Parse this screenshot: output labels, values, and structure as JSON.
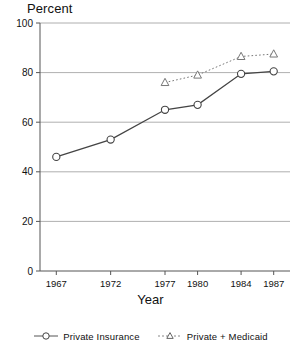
{
  "chart_data": {
    "type": "line",
    "title": "",
    "ylabel": "Percent",
    "xlabel": "Year",
    "categories": [
      "1967",
      "1972",
      "1977",
      "1980",
      "1984",
      "1987"
    ],
    "x": [
      1967,
      1972,
      1977,
      1980,
      1984,
      1987
    ],
    "xlim": [
      1965.5,
      1988.5
    ],
    "ylim": [
      0,
      100
    ],
    "yticks": [
      0,
      20,
      40,
      60,
      80,
      100
    ],
    "ytick_labels": [
      "0",
      "20",
      "40",
      "60",
      "80",
      "100"
    ],
    "xtick_labels": [
      "1967",
      "1972",
      "1977",
      "1980",
      "1984",
      "1987"
    ],
    "grid": "horizontal",
    "legend_position": "bottom",
    "series": [
      {
        "name": "Private Insurance",
        "marker": "circle",
        "linestyle": "solid",
        "color": "#444444",
        "x": [
          1967,
          1972,
          1977,
          1980,
          1984,
          1987
        ],
        "values": [
          46,
          53,
          65,
          67,
          79.5,
          80.5
        ]
      },
      {
        "name": "Private + Medicaid",
        "marker": "triangle",
        "linestyle": "dotted",
        "color": "#777777",
        "x": [
          1977,
          1980,
          1984,
          1987
        ],
        "values": [
          76,
          79,
          86.5,
          87.5
        ]
      }
    ]
  },
  "legend": {
    "items": [
      {
        "label": "Private Insurance",
        "marker": "circle-marker",
        "line": "solid"
      },
      {
        "label": "Private + Medicaid",
        "marker": "triangle-marker",
        "line": "dotted"
      }
    ]
  }
}
